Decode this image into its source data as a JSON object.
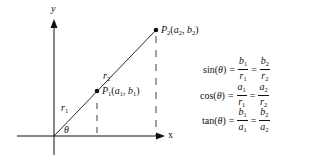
{
  "diagram": {
    "axes": {
      "x_label": "x",
      "y_label": "y",
      "angle_label": "θ"
    },
    "points": [
      {
        "name": "P",
        "sub": "1",
        "coord_a": "a",
        "coord_a_sub": "1",
        "coord_b": "b",
        "coord_b_sub": "1",
        "x": 97,
        "y": 91
      },
      {
        "name": "P",
        "sub": "2",
        "coord_a": "a",
        "coord_a_sub": "2",
        "coord_b": "b",
        "coord_b_sub": "2",
        "x": 156,
        "y": 30
      }
    ],
    "segments": [
      {
        "label": "r",
        "sub": "1"
      },
      {
        "label": "r",
        "sub": "2"
      }
    ],
    "colors": {
      "ink": "#111111",
      "background": "#ffffff"
    }
  },
  "equations": [
    {
      "fn": "sin",
      "arg": "θ",
      "num1": "b",
      "num1_sub": "1",
      "den1": "r",
      "den1_sub": "1",
      "num2": "b",
      "num2_sub": "2",
      "den2": "r",
      "den2_sub": "2"
    },
    {
      "fn": "cos",
      "arg": "θ",
      "num1": "a",
      "num1_sub": "1",
      "den1": "r",
      "den1_sub": "1",
      "num2": "a",
      "num2_sub": "2",
      "den2": "r",
      "den2_sub": "2"
    },
    {
      "fn": "tan",
      "arg": "θ",
      "num1": "b",
      "num1_sub": "1",
      "den1": "a",
      "den1_sub": "1",
      "num2": "b",
      "num2_sub": "2",
      "den2": "a",
      "den2_sub": "2"
    }
  ],
  "symbols": {
    "lparen": "(",
    "rparen": ")",
    "equals": "=",
    "comma": ", "
  }
}
